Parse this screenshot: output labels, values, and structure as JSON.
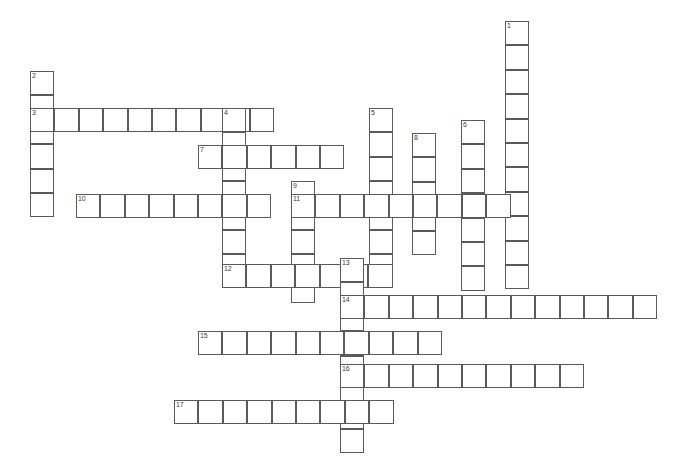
{
  "puzzle": {
    "title": "Crossword Puzzle Grid",
    "width": 686,
    "height": 468,
    "cell_size": 24.4,
    "origin_x": 30,
    "origin_y": 21,
    "cell_border_color": "#5a5a5a",
    "cell_fill_color": "#ffffff",
    "background_color": "#ffffff",
    "number_color": "#3a3a3a",
    "total_entries": 17,
    "across_count": 9,
    "down_count": 8
  },
  "entries": [
    {
      "number": "1",
      "direction": "down",
      "x": 505,
      "y": 21,
      "length": 11,
      "letters": [
        "",
        "",
        "",
        "",
        "",
        "",
        "",
        "",
        "",
        "",
        ""
      ]
    },
    {
      "number": "2",
      "direction": "down",
      "x": 30,
      "y": 71,
      "length": 6,
      "letters": [
        "",
        "",
        "",
        "",
        "",
        ""
      ]
    },
    {
      "number": "3",
      "direction": "across",
      "x": 30,
      "y": 108,
      "length": 10,
      "letters": [
        "",
        "",
        "",
        "",
        "",
        "",
        "",
        "",
        "",
        ""
      ]
    },
    {
      "number": "4",
      "direction": "down",
      "x": 222,
      "y": 108,
      "length": 7,
      "letters": [
        "",
        "",
        "",
        "",
        "",
        "",
        ""
      ]
    },
    {
      "number": "5",
      "direction": "down",
      "x": 369,
      "y": 108,
      "length": 7,
      "letters": [
        "",
        "",
        "",
        "",
        "",
        "",
        ""
      ]
    },
    {
      "number": "6",
      "direction": "down",
      "x": 461,
      "y": 120,
      "length": 7,
      "letters": [
        "",
        "",
        "",
        "",
        "",
        "",
        ""
      ]
    },
    {
      "number": "7",
      "direction": "across",
      "x": 198,
      "y": 145,
      "length": 6,
      "letters": [
        "",
        "",
        "",
        "",
        "",
        ""
      ]
    },
    {
      "number": "8",
      "direction": "down",
      "x": 412,
      "y": 133,
      "length": 5,
      "letters": [
        "",
        "",
        "",
        "",
        ""
      ]
    },
    {
      "number": "9",
      "direction": "down",
      "x": 291,
      "y": 181,
      "length": 5,
      "letters": [
        "",
        "",
        "",
        "",
        ""
      ]
    },
    {
      "number": "10",
      "direction": "across",
      "x": 76,
      "y": 194,
      "length": 8,
      "letters": [
        "",
        "",
        "",
        "",
        "",
        "",
        "",
        ""
      ]
    },
    {
      "number": "11",
      "direction": "across",
      "x": 291,
      "y": 194,
      "length": 9,
      "letters": [
        "",
        "",
        "",
        "",
        "",
        "",
        "",
        "",
        ""
      ]
    },
    {
      "number": "12",
      "direction": "across",
      "x": 222,
      "y": 264,
      "length": 7,
      "letters": [
        "",
        "",
        "",
        "",
        "",
        "",
        ""
      ]
    },
    {
      "number": "13",
      "direction": "down",
      "x": 340,
      "y": 258,
      "length": 8,
      "letters": [
        "",
        "",
        "",
        "",
        "",
        "",
        "",
        ""
      ]
    },
    {
      "number": "14",
      "direction": "across",
      "x": 340,
      "y": 295,
      "length": 13,
      "letters": [
        "",
        "",
        "",
        "",
        "",
        "",
        "",
        "",
        "",
        "",
        "",
        "",
        ""
      ]
    },
    {
      "number": "15",
      "direction": "across",
      "x": 198,
      "y": 331,
      "length": 10,
      "letters": [
        "",
        "",
        "",
        "",
        "",
        "",
        "",
        "",
        "",
        ""
      ]
    },
    {
      "number": "16",
      "direction": "across",
      "x": 340,
      "y": 364,
      "length": 10,
      "letters": [
        "",
        "",
        "",
        "",
        "",
        "",
        "",
        "",
        "",
        ""
      ]
    },
    {
      "number": "17",
      "direction": "across",
      "x": 174,
      "y": 400,
      "length": 9,
      "letters": [
        "",
        "",
        "",
        "",
        "",
        "",
        "",
        "",
        ""
      ]
    }
  ]
}
